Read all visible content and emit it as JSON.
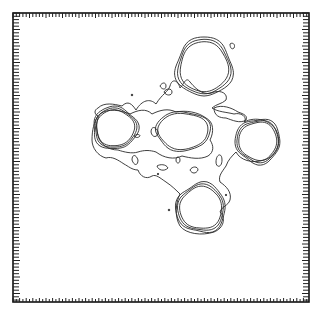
{
  "chart_data": {
    "type": "contour",
    "title": "",
    "xlabel": "",
    "ylabel": "",
    "grid": false,
    "legend": null,
    "frame": {
      "x0": 13,
      "y0": 13,
      "x1": 309,
      "y1": 302,
      "stroke": "#111111"
    },
    "ticks": {
      "spacing": 3.3,
      "length": 5,
      "minor_length": 3,
      "major_every": 5,
      "color": "#222222"
    },
    "contour_color": "#2a2a2a",
    "peaks": [
      {
        "name": "top",
        "cx": 204,
        "cy": 67,
        "rx": 24,
        "ry": 25,
        "levels": 3
      },
      {
        "name": "left",
        "cx": 115,
        "cy": 128,
        "rx": 19,
        "ry": 18,
        "levels": 3
      },
      {
        "name": "center",
        "cx": 183,
        "cy": 131,
        "rx": 25,
        "ry": 18,
        "levels": 2
      },
      {
        "name": "right",
        "cx": 258,
        "cy": 141,
        "rx": 19,
        "ry": 19,
        "levels": 3
      },
      {
        "name": "bottom",
        "cx": 201,
        "cy": 208,
        "rx": 21,
        "ry": 21,
        "levels": 3
      }
    ]
  }
}
